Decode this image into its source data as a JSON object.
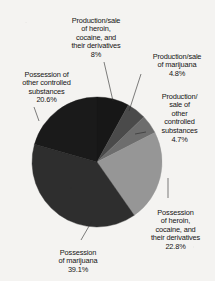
{
  "chart_data": {
    "type": "pie",
    "title": "",
    "subtitle": "",
    "xlabel": "",
    "ylabel": "",
    "legend_position": "none",
    "grid": false,
    "start_angle_deg": 0,
    "direction": "clockwise",
    "categories": [
      "Production/sale of heroin, cocaine, and their derivatives",
      "Production/sale of marijuana",
      "Production/sale of other controlled substances",
      "Possession of heroin, cocaine, and their derivatives",
      "Possession of marijuana",
      "Possession of other controlled substances"
    ],
    "values": [
      8,
      4.8,
      4.7,
      22.8,
      39.1,
      20.6
    ],
    "value_labels": [
      "8%",
      "4.8%",
      "4.7%",
      "22.8%",
      "39.1%",
      "20.6%"
    ],
    "colors": [
      "#171717",
      "#4a4a4a",
      "#6d6d6d",
      "#969696",
      "#2e2e2e",
      "#1a1a1a"
    ],
    "slices": [
      {
        "name": "production-sale-heroin-cocaine",
        "label": "Production/sale\nof heroin,\ncocaine, and\ntheir derivatives",
        "percent_label": "8%",
        "value": 8,
        "color": "#171717"
      },
      {
        "name": "production-sale-marijuana",
        "label": "Production/sale\nof marijuana",
        "percent_label": "4.8%",
        "value": 4.8,
        "color": "#4a4a4a"
      },
      {
        "name": "production-sale-other-controlled-substances",
        "label": "Production/\nsale of\nother\ncontrolled\nsubstances",
        "percent_label": "4.7%",
        "value": 4.7,
        "color": "#6d6d6d"
      },
      {
        "name": "possession-heroin-cocaine",
        "label": "Possession\nof heroin,\ncocaine, and\ntheir derivatives",
        "percent_label": "22.8%",
        "value": 22.8,
        "color": "#969696"
      },
      {
        "name": "possession-marijuana",
        "label": "Possession\nof marijuana",
        "percent_label": "39.1%",
        "value": 39.1,
        "color": "#2e2e2e"
      },
      {
        "name": "possession-other-controlled-substances",
        "label": "Possession of\nother controlled\nsubstances",
        "percent_label": "20.6%",
        "value": 20.6,
        "color": "#1a1a1a"
      }
    ]
  }
}
